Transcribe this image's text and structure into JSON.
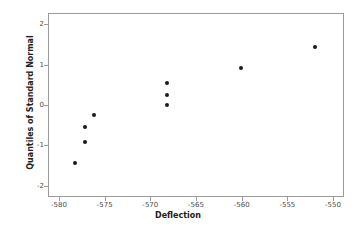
{
  "chart_data": {
    "type": "scatter",
    "title": "",
    "xlabel": "Deflection",
    "ylabel": "Quantiles of Standard Normal",
    "xlim": [
      -581.2,
      -548.8
    ],
    "ylim": [
      -2.28,
      2.28
    ],
    "grid": false,
    "legend": null,
    "marker": {
      "shape": "circle",
      "color": "#1a1a1a",
      "size": 4
    },
    "xticks": [
      -580,
      -575,
      -570,
      -565,
      -560,
      -555,
      -550
    ],
    "xticklabels": [
      "-580",
      "-575",
      "-570",
      "-565",
      "-560",
      "-555",
      "-550"
    ],
    "yticks": [
      2,
      1,
      0,
      -1,
      -2
    ],
    "yticklabels": [
      "2",
      "1",
      "0",
      "-1",
      "-2"
    ],
    "x": [
      -578.2,
      -577.1,
      -577.1,
      -576.2,
      -568.2,
      -568.2,
      -568.2,
      -560.1,
      -552.0
    ],
    "y": [
      -1.43,
      -0.91,
      -0.55,
      -0.26,
      0.0,
      0.26,
      0.55,
      0.91,
      1.43
    ],
    "points": [
      {
        "x": -578.2,
        "y": -1.43
      },
      {
        "x": -577.1,
        "y": -0.91
      },
      {
        "x": -577.1,
        "y": -0.55
      },
      {
        "x": -576.2,
        "y": -0.26
      },
      {
        "x": -568.2,
        "y": 0.0
      },
      {
        "x": -568.2,
        "y": 0.26
      },
      {
        "x": -568.2,
        "y": 0.55
      },
      {
        "x": -560.1,
        "y": 0.91
      },
      {
        "x": -552.0,
        "y": 1.43
      }
    ],
    "frame": {
      "color": "#9a9a9a",
      "visible": true
    }
  }
}
